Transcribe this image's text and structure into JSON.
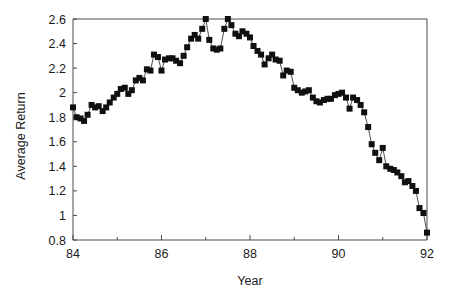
{
  "chart_data": {
    "type": "line",
    "title": "",
    "subtitle": "",
    "xlabel": "Year",
    "ylabel": "Average Return",
    "xlim": [
      84,
      92
    ],
    "ylim": [
      0.8,
      2.6
    ],
    "xticks": [
      84,
      86,
      88,
      90,
      92
    ],
    "xtick_labels": [
      "84",
      "86",
      "88",
      "90",
      "92"
    ],
    "xminor_ticks": [
      85,
      87,
      89,
      91
    ],
    "yticks": [
      0.8,
      1.0,
      1.2,
      1.4,
      1.6,
      1.8,
      2.0,
      2.2,
      2.4,
      2.6
    ],
    "ytick_labels": [
      "0.8",
      "1",
      "1.2",
      "1.4",
      "1.6",
      "1.8",
      "2",
      "2.2",
      "2.4",
      "2.6"
    ],
    "grid": false,
    "legend": null,
    "legend_position": "none",
    "marker": "filled-square",
    "marker_size_px": 6,
    "line_color": "#303030",
    "marker_color": "#101010",
    "series": [
      {
        "name": "Average Return",
        "x": [
          84.0,
          84.08,
          84.17,
          84.25,
          84.33,
          84.42,
          84.5,
          84.58,
          84.67,
          84.75,
          84.83,
          84.92,
          85.0,
          85.08,
          85.17,
          85.25,
          85.33,
          85.42,
          85.5,
          85.58,
          85.67,
          85.75,
          85.83,
          85.92,
          86.0,
          86.08,
          86.17,
          86.25,
          86.33,
          86.42,
          86.5,
          86.58,
          86.67,
          86.75,
          86.83,
          86.92,
          87.0,
          87.08,
          87.17,
          87.25,
          87.33,
          87.42,
          87.5,
          87.58,
          87.67,
          87.75,
          87.83,
          87.92,
          88.0,
          88.08,
          88.17,
          88.25,
          88.33,
          88.42,
          88.5,
          88.58,
          88.67,
          88.75,
          88.83,
          88.92,
          89.0,
          89.08,
          89.17,
          89.25,
          89.33,
          89.42,
          89.5,
          89.58,
          89.67,
          89.75,
          89.83,
          89.92,
          90.0,
          90.08,
          90.17,
          90.25,
          90.33,
          90.42,
          90.5,
          90.58,
          90.67,
          90.75,
          90.83,
          90.92,
          91.0,
          91.08,
          91.17,
          91.25,
          91.33,
          91.42,
          91.5,
          91.58,
          91.67,
          91.75,
          91.83,
          91.92,
          92.0
        ],
        "values": [
          1.88,
          1.8,
          1.79,
          1.77,
          1.82,
          1.9,
          1.88,
          1.89,
          1.85,
          1.88,
          1.92,
          1.96,
          1.99,
          2.03,
          2.04,
          1.99,
          2.02,
          2.1,
          2.12,
          2.1,
          2.19,
          2.18,
          2.31,
          2.29,
          2.18,
          2.27,
          2.28,
          2.28,
          2.26,
          2.24,
          2.3,
          2.37,
          2.44,
          2.47,
          2.44,
          2.52,
          2.6,
          2.43,
          2.36,
          2.35,
          2.36,
          2.52,
          2.6,
          2.55,
          2.48,
          2.46,
          2.5,
          2.48,
          2.45,
          2.38,
          2.34,
          2.31,
          2.23,
          2.28,
          2.31,
          2.27,
          2.26,
          2.14,
          2.18,
          2.17,
          2.04,
          2.02,
          2.0,
          2.01,
          2.02,
          1.96,
          1.93,
          1.92,
          1.94,
          1.95,
          1.95,
          1.98,
          1.99,
          2.0,
          1.96,
          1.87,
          1.96,
          1.94,
          1.9,
          1.84,
          1.72,
          1.58,
          1.51,
          1.45,
          1.55,
          1.4,
          1.38,
          1.37,
          1.35,
          1.32,
          1.27,
          1.28,
          1.24,
          1.2,
          1.06,
          1.02,
          0.86
        ]
      }
    ]
  },
  "axes": {
    "ylabel": "Average Return",
    "xlabel": "Year"
  }
}
